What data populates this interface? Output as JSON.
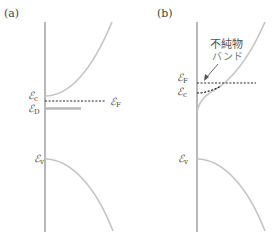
{
  "panels": [
    {
      "label": "(a)",
      "levels": {
        "Ec": {
          "sym": "ℰ",
          "sub": "c"
        },
        "EF": {
          "sym": "ℰ",
          "sub": "F"
        },
        "ED": {
          "sym": "ℰ",
          "sub": "D"
        },
        "Ev": {
          "sym": "ℰ",
          "sub": "v"
        }
      }
    },
    {
      "label": "(b)",
      "annotation": {
        "line1": "不純物",
        "line2": "バンド"
      },
      "levels": {
        "EF": {
          "sym": "ℰ",
          "sub": "F"
        },
        "Ec": {
          "sym": "ℰ",
          "sub": "c"
        },
        "Ev": {
          "sym": "ℰ",
          "sub": "v"
        }
      }
    }
  ],
  "colors": {
    "axis": "#8a8a8a",
    "band": "#c4c4c4",
    "fermi_dashed": "#222222",
    "donor_level": "#b8b8b8"
  }
}
